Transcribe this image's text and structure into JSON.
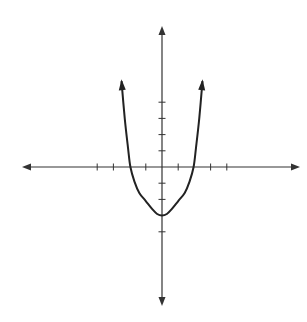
{
  "chart_data": {
    "type": "line",
    "title": "",
    "xlabel": "",
    "ylabel": "",
    "xlim": [
      -9,
      9
    ],
    "ylim": [
      -9,
      9
    ],
    "grid": false,
    "x_ticks": [
      -4,
      -3,
      -1,
      1,
      3,
      4
    ],
    "y_ticks": [
      -4,
      -2,
      -1,
      1,
      2,
      3,
      4
    ],
    "series": [
      {
        "name": "curve",
        "arrows_at_ends": true,
        "x": [
          -2.5,
          -2.3,
          -2.1,
          -1.95,
          -1.7,
          -1.4,
          -1.0,
          -0.6,
          -0.3,
          0,
          0.3,
          0.6,
          1.0,
          1.4,
          1.7,
          1.95,
          2.1,
          2.3,
          2.5
        ],
        "y": [
          5.3,
          3.0,
          1.2,
          0,
          -0.9,
          -1.6,
          -2.1,
          -2.6,
          -2.9,
          -3.0,
          -2.9,
          -2.6,
          -2.1,
          -1.6,
          -0.9,
          0,
          1.2,
          3.0,
          5.3
        ]
      }
    ],
    "colors": {
      "axis": "#333333",
      "curve": "#222222"
    }
  }
}
